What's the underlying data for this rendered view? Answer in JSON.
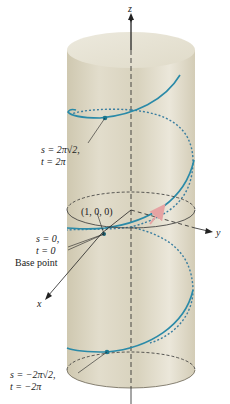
{
  "figure": {
    "axes": {
      "z_label": "z",
      "y_label": "y",
      "x_label": "x"
    },
    "labels": {
      "top_point_s": "s = 2π√2,",
      "top_point_t": "t = 2π",
      "origin_coord": "(1, 0, 0)",
      "base_s": "s = 0,",
      "base_t": "t = 0",
      "base_caption": "Base point",
      "bottom_point_s": "s = −2π√2,",
      "bottom_point_t": "t = −2π"
    },
    "colors": {
      "cylinder": "#ddd8c6",
      "cylinder_shade": "#c9c2a8",
      "helix": "#2a8aa8",
      "helix_dot": "#1a7890",
      "axis": "#222222",
      "tangent_arrow": "#e0a0a0"
    }
  }
}
